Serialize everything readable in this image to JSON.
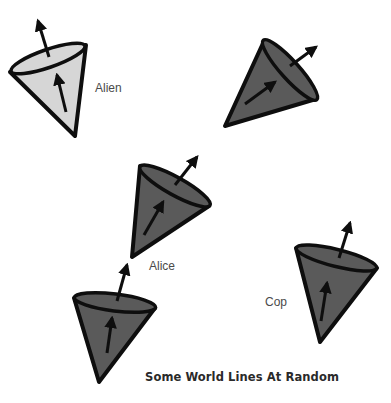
{
  "caption": "Some World Lines At Random",
  "colors": {
    "light_cone_fill": "#d6d6d6",
    "dark_cone_fill": "#5a5a5a",
    "stroke": "#0e0e0e",
    "label_text": "#4a4a4a",
    "caption_text": "#2a2a2a"
  },
  "cones": [
    {
      "id": "alien",
      "label": "Alien",
      "fill": "light"
    },
    {
      "id": "unlabeled-top-right",
      "label": "",
      "fill": "dark"
    },
    {
      "id": "alice",
      "label": "Alice",
      "fill": "dark"
    },
    {
      "id": "unlabeled-bottom-left",
      "label": "",
      "fill": "dark"
    },
    {
      "id": "cop",
      "label": "Cop",
      "fill": "dark"
    }
  ]
}
